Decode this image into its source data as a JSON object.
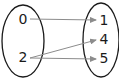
{
  "diagram": {
    "type": "mapping",
    "domain_set": {
      "elements": [
        {
          "id": "d0",
          "label": "0"
        },
        {
          "id": "d1",
          "label": "2"
        }
      ]
    },
    "codomain_set": {
      "elements": [
        {
          "id": "c0",
          "label": "1"
        },
        {
          "id": "c1",
          "label": "4"
        },
        {
          "id": "c2",
          "label": "5"
        }
      ]
    },
    "arrows": [
      {
        "from": "0",
        "to": "1"
      },
      {
        "from": "2",
        "to": "4"
      },
      {
        "from": "2",
        "to": "5"
      }
    ],
    "colors": {
      "ellipse_stroke": "#1a1a1a",
      "arrow": "#8c8c8c",
      "text": "#1a1a1a"
    }
  }
}
